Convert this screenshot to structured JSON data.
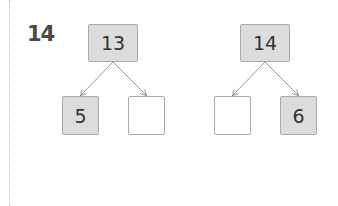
{
  "question_number": "14",
  "bonds": [
    {
      "whole": "13",
      "parts": [
        "5",
        ""
      ]
    },
    {
      "whole": "14",
      "parts": [
        "",
        "6"
      ]
    }
  ],
  "colors": {
    "filled_box": "#dcdcdc",
    "empty_box": "#ffffff",
    "arrow": "#999999"
  }
}
